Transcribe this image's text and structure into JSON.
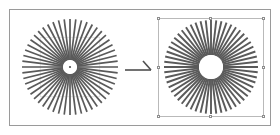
{
  "canvas": {
    "width": 280,
    "height": 135,
    "background": "#ffffff",
    "frame_color": "#9a9a9a"
  },
  "left_figure": {
    "name": "source-starburst",
    "label": "",
    "center_x": 52,
    "center_y": 51,
    "outer_radius": 48,
    "inner_radius": 7,
    "spoke_count": 52,
    "spoke_color": "#5a5a5a",
    "spoke_width": 1.7,
    "hub_color": "#ffffff",
    "center_dot_color": "#4a4a4a",
    "center_dot_radius": 1.1,
    "guide_color": "#d6d6d6",
    "guides_visible": true
  },
  "right_figure": {
    "name": "resized-starburst",
    "label": "",
    "center_x": 53,
    "center_y": 49,
    "outer_radius": 47,
    "inner_radius": 12,
    "spoke_count": 56,
    "spoke_color": "#5a5a5a",
    "spoke_width": 1.9,
    "hub_color": "#ffffff",
    "selected": true,
    "selection_border_color": "#b9b9b9",
    "handle_fill": "#ffffff",
    "handle_border": "#8d8d8d",
    "handle_count": 8
  },
  "arrow": {
    "name": "transform-arrow",
    "direction": "right",
    "color": "#4f4f4f",
    "line_width": 1.6,
    "length": 26
  }
}
